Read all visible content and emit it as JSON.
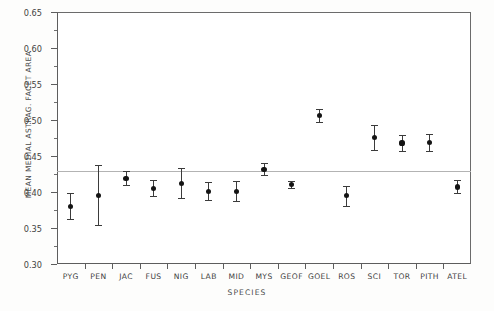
{
  "chart_data": {
    "type": "scatter",
    "title": "",
    "xlabel": "SPECIES",
    "ylabel": "MEAN MEDIAL ASTRAG. FACET AREA",
    "ylim": [
      0.3,
      0.65
    ],
    "yticks": [
      "0.30",
      "0.35",
      "0.40",
      "0.45",
      "0.50",
      "0.55",
      "0.60",
      "0.65"
    ],
    "grid": false,
    "legend": "none",
    "reference_line": {
      "y": 0.429,
      "style": "thin-solid-gray"
    },
    "error_bar_style": "mean with capped range bars",
    "categories": [
      "PYG",
      "PEN",
      "JAC",
      "FUS",
      "NIG",
      "LAB",
      "MID",
      "MYS",
      "GEOF",
      "GOEL",
      "ROS",
      "SCI",
      "TOR",
      "PITH",
      "ATEL"
    ],
    "values": [
      0.38,
      0.395,
      0.419,
      0.405,
      0.412,
      0.401,
      0.401,
      0.431,
      0.41,
      0.506,
      0.395,
      0.476,
      0.468,
      0.469,
      0.407
    ],
    "lower": [
      0.362,
      0.354,
      0.41,
      0.395,
      0.392,
      0.389,
      0.387,
      0.423,
      0.405,
      0.497,
      0.381,
      0.458,
      0.457,
      0.457,
      0.398
    ],
    "upper": [
      0.398,
      0.437,
      0.429,
      0.416,
      0.434,
      0.414,
      0.415,
      0.44,
      0.415,
      0.515,
      0.409,
      0.493,
      0.479,
      0.481,
      0.417
    ]
  }
}
